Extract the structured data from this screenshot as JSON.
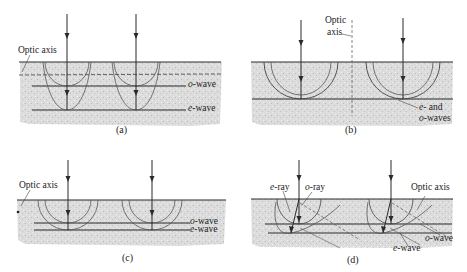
{
  "figure": {
    "panels": [
      {
        "id": "a",
        "caption": "(a)",
        "labels": {
          "optic_axis": "Optic axis",
          "o_wave": "o-wave",
          "e_wave": "e-wave"
        },
        "o_wave_prefix": "o",
        "o_wave_suffix": "-wave",
        "e_wave_prefix": "e",
        "e_wave_suffix": "-wave"
      },
      {
        "id": "b",
        "caption": "(b)",
        "labels": {
          "optic_axis_line1": "Optic",
          "optic_axis_line2": "axis",
          "waves_line1": "e- and",
          "waves_line2": "o-waves"
        },
        "e_prefix": "e",
        "e_suffix": "- and",
        "o_prefix": "o",
        "o_suffix": "-waves"
      },
      {
        "id": "c",
        "caption": "(c)",
        "labels": {
          "optic_axis": "Optic axis",
          "o_wave": "o-wave",
          "e_wave": "e-wave"
        },
        "o_wave_prefix": "o",
        "o_wave_suffix": "-wave",
        "e_wave_prefix": "e",
        "e_wave_suffix": "-wave"
      },
      {
        "id": "d",
        "caption": "(d)",
        "labels": {
          "e_ray": "e-ray",
          "o_ray": "o-ray",
          "optic_axis": "Optic axis",
          "o_wave": "o-wave",
          "e_wave": "e-wave"
        },
        "e_ray_prefix": "e",
        "e_ray_suffix": "-ray",
        "o_ray_prefix": "o",
        "o_ray_suffix": "-ray",
        "o_wave_prefix": "o",
        "o_wave_suffix": "-wave",
        "e_wave_prefix": "e",
        "e_wave_suffix": "-wave"
      }
    ],
    "colors": {
      "line": "#2a2a2a",
      "crystal": "#d9d9d9",
      "crystal_dark": "#c4c4c4",
      "background": "#ffffff"
    }
  }
}
